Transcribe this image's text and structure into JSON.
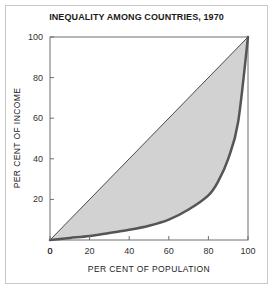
{
  "figure": {
    "title": "INEQUALITY AMONG COUNTRIES, 1970",
    "frame_color": "#c8c8c8",
    "background": "#ffffff"
  },
  "chart_data": {
    "type": "area",
    "title": "INEQUALITY AMONG COUNTRIES, 1970",
    "subtitle": "",
    "xlabel": "PER CENT OF POPULATION",
    "ylabel": "PER CENT OF INCOME",
    "xlim": [
      0,
      100
    ],
    "ylim": [
      0,
      100
    ],
    "xticks": [
      0,
      20,
      40,
      60,
      80,
      100
    ],
    "yticks": [
      0,
      20,
      40,
      60,
      80,
      100
    ],
    "xtick_labels": [
      "0",
      "20",
      "40",
      "60",
      "80",
      "100"
    ],
    "ytick_labels": [
      "0",
      "20",
      "40",
      "60",
      "80",
      "100"
    ],
    "grid": false,
    "legend": false,
    "legend_position": "none",
    "annotations": [],
    "series": [
      {
        "name": "Line of equality",
        "type": "line",
        "color": "#4a4a4a",
        "linewidth": 1,
        "x": [
          0,
          100
        ],
        "values": [
          0,
          100
        ]
      },
      {
        "name": "Lorenz curve",
        "type": "line",
        "color": "#555555",
        "linewidth": 2.5,
        "x": [
          0,
          10,
          20,
          30,
          40,
          50,
          60,
          70,
          80,
          85,
          90,
          95,
          100
        ],
        "values": [
          0,
          1,
          2,
          3.5,
          5,
          7,
          10,
          15,
          22,
          29,
          40,
          58,
          100
        ]
      }
    ],
    "fill_between": {
      "name": "Area of inequality",
      "color": "#d2d2d2",
      "upper_series": "Line of equality",
      "lower_series": "Lorenz curve"
    }
  }
}
